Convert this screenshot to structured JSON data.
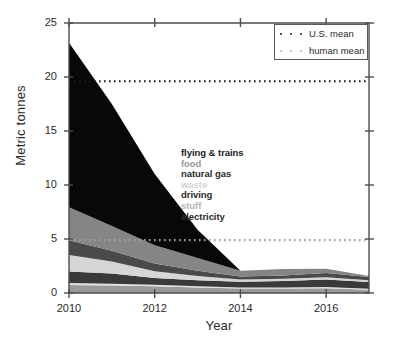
{
  "chart_data": {
    "type": "area",
    "title": "",
    "subtitle": "",
    "xlabel": "Year",
    "ylabel": "Metric tonnes",
    "xlim": [
      2010,
      2017
    ],
    "ylim": [
      0,
      25
    ],
    "xticks": [
      2010,
      2012,
      2014,
      2016
    ],
    "xticklabels": [
      "2010",
      "2012",
      "2014",
      "2016"
    ],
    "yticks": [
      0,
      5,
      10,
      15,
      20,
      25
    ],
    "yticklabels": [
      "0",
      "5",
      "10",
      "15",
      "20",
      "25"
    ],
    "grid": false,
    "stacked": true,
    "stack_order_top_to_bottom": [
      "flying & trains",
      "food",
      "natural gas",
      "waste",
      "driving",
      "stuff",
      "electricity"
    ],
    "x": [
      2010,
      2011,
      2012,
      2013,
      2014,
      2015,
      2016,
      2017
    ],
    "series": [
      {
        "name": "electricity",
        "color": "#9a9a9a",
        "label_color": "#8c8c8c",
        "values": [
          0.75,
          0.7,
          0.62,
          0.5,
          0.42,
          0.42,
          0.45,
          0.3
        ]
      },
      {
        "name": "stuff",
        "color": "#e0e0e0",
        "label_color": "#cbcbcb",
        "values": [
          0.18,
          0.16,
          0.15,
          0.12,
          0.1,
          0.1,
          0.1,
          0.1
        ]
      },
      {
        "name": "driving",
        "color": "#3a3a3a",
        "label_color": "#333333",
        "values": [
          1.05,
          0.95,
          0.62,
          0.55,
          0.52,
          0.6,
          0.7,
          0.62
        ]
      },
      {
        "name": "waste",
        "color": "#d6d6d6",
        "label_color": "#d0d0d0",
        "values": [
          1.55,
          1.1,
          0.62,
          0.4,
          0.2,
          0.2,
          0.2,
          0.15
        ]
      },
      {
        "name": "natural gas",
        "color": "#4a4a4a",
        "label_color": "#333333",
        "values": [
          1.35,
          1.0,
          0.72,
          0.48,
          0.28,
          0.3,
          0.4,
          0.3
        ]
      },
      {
        "name": "food",
        "color": "#858585",
        "label_color": "#9a9a9a",
        "values": [
          3.05,
          2.3,
          1.7,
          1.2,
          0.55,
          0.6,
          0.4,
          0.1
        ]
      },
      {
        "name": "flying & trains",
        "color": "#080808",
        "label_color": "#1a1a1a",
        "values": [
          15.25,
          11.3,
          6.6,
          2.6,
          0.0,
          0.0,
          0.0,
          0.0
        ]
      }
    ],
    "reference_lines": [
      {
        "name": "U.S. mean",
        "value": 19.6,
        "color": "#1a1a1a",
        "style": "dotted"
      },
      {
        "name": "human mean",
        "value": 4.9,
        "color": "#9e9e9e",
        "style": "dotted"
      }
    ],
    "annotations": {
      "series_labels": [
        {
          "text": "flying & trains",
          "color": "#1a1a1a"
        },
        {
          "text": "food",
          "color": "#9a9a9a"
        },
        {
          "text": "natural gas",
          "color": "#2b2b2b"
        },
        {
          "text": "waste",
          "color": "#d2d2d2"
        },
        {
          "text": "driving",
          "color": "#2b2b2b"
        },
        {
          "text": "stuff",
          "color": "#b5b5b5"
        },
        {
          "text": "electricity",
          "color": "#2b2b2b"
        }
      ]
    },
    "legend": {
      "position": "top-right",
      "entries": [
        {
          "label": "U.S. mean",
          "color": "#1a1a1a"
        },
        {
          "label": "human mean",
          "color": "#b0b0b0"
        }
      ]
    }
  }
}
